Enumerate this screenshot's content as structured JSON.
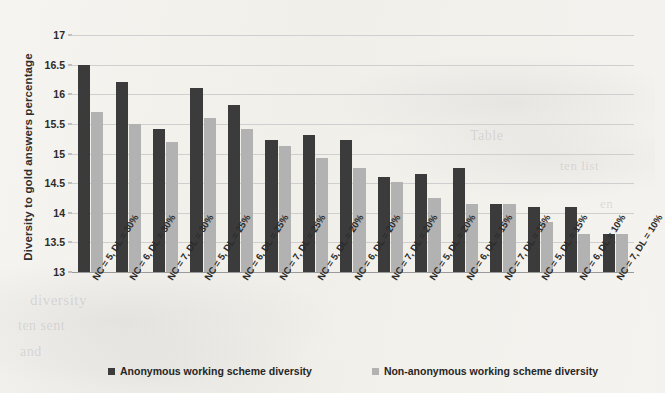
{
  "chart_data": {
    "type": "bar",
    "title": "",
    "xlabel": "",
    "ylabel": "Diversity to gold answers percentage",
    "ylim": [
      13,
      17
    ],
    "ytick_values": [
      13,
      13.5,
      14,
      14.5,
      15,
      15.5,
      16,
      16.5,
      17
    ],
    "ytick_labels": [
      "13",
      "13.5",
      "14",
      "14.5",
      "15",
      "15.5",
      "16",
      "16.5",
      "17"
    ],
    "grid": true,
    "legend_position": "bottom",
    "categories": [
      "NC = 5, DL = 30%",
      "NC = 6, DL = 30%",
      "NC = 7, DL = 30%",
      "NC = 5, DL = 25%",
      "NC = 6, DL = 25%",
      "NC = 7, DL = 25%",
      "NC = 5, DL = 20%",
      "NC = 6, DL = 20%",
      "NC = 7, DL = 20%",
      "NC = 5, DL = 20%",
      "NC = 6, DL = 15%",
      "NC = 7, DL = 15%",
      "NC = 5, DL = 15%",
      "NC = 6, DL = 10%",
      "NC = 7, DL = 10%"
    ],
    "series": [
      {
        "name": "Anonymous working scheme diversity",
        "color": "#3b3b3b",
        "values": [
          16.5,
          16.2,
          15.42,
          16.1,
          15.82,
          15.22,
          15.32,
          15.22,
          14.6,
          14.65,
          14.75,
          14.15,
          14.1,
          14.1,
          13.65
        ]
      },
      {
        "name": "Non-anonymous working scheme diversity",
        "color": "#b2b2b2",
        "values": [
          15.7,
          15.5,
          15.2,
          15.6,
          15.42,
          15.12,
          14.92,
          14.75,
          14.52,
          14.25,
          14.15,
          14.15,
          13.85,
          13.65,
          13.65
        ]
      }
    ]
  },
  "legend": {
    "items": [
      {
        "label": "Anonymous working scheme diversity",
        "swatch": "dark-square-icon"
      },
      {
        "label": "Non-anonymous working scheme diversity",
        "swatch": "light-square-icon"
      }
    ]
  },
  "background_bleed": [
    {
      "text": "diversity",
      "left": 30,
      "top": 292,
      "size": 15,
      "rotate": 0
    },
    {
      "text": "ten sent",
      "left": 18,
      "top": 318,
      "size": 14,
      "rotate": 0
    },
    {
      "text": "and",
      "left": 20,
      "top": 344,
      "size": 14,
      "rotate": 0
    },
    {
      "text": "Table",
      "left": 470,
      "top": 128,
      "size": 14,
      "rotate": 0
    },
    {
      "text": "ten list",
      "left": 560,
      "top": 158,
      "size": 13,
      "rotate": 0
    },
    {
      "text": "en",
      "left": 600,
      "top": 196,
      "size": 13,
      "rotate": 0
    }
  ]
}
